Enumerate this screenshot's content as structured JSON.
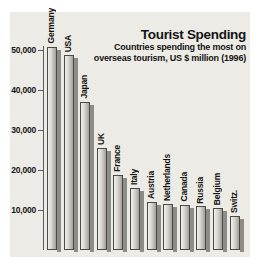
{
  "title": "Tourist Spending",
  "subtitle_line1": "Countries spending the most on",
  "subtitle_line2": "overseas tourism, US $ million (1996)",
  "chart_data": {
    "type": "bar",
    "title": "Tourist Spending",
    "subtitle": "Countries spending the most on overseas tourism, US $ million (1996)",
    "categories": [
      "Germany",
      "USA",
      "Japan",
      "UK",
      "France",
      "Italy",
      "Austria",
      "Netherlands",
      "Canada",
      "Russia",
      "Belgium",
      "Switz."
    ],
    "values": [
      50800,
      48700,
      37000,
      25500,
      18800,
      15400,
      12000,
      11500,
      11300,
      10900,
      10400,
      8500
    ],
    "xlabel": "",
    "ylabel": "US $ million",
    "ylim": [
      0,
      55000
    ],
    "yticks": [
      10000,
      20000,
      30000,
      40000,
      50000
    ],
    "ytick_labels": [
      "10,000",
      "20,000",
      "30,000",
      "40,000",
      "50,000"
    ],
    "grid": false,
    "legend": false,
    "bar_style": "3d-shadow"
  },
  "colors": {
    "panel_bg": "#edebe6",
    "bar_light": "#f2f0eb",
    "bar_dark": "#a29f98",
    "bar_outline": "#4a4a46",
    "bar_shadow": "#8e8c87",
    "axis": "#5a5a56",
    "text": "#141414"
  }
}
